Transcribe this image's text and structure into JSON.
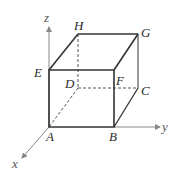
{
  "diagram": {
    "type": "cube-3d-axes",
    "axes": {
      "x": "x",
      "y": "y",
      "z": "z"
    },
    "vertices": {
      "A": "A",
      "B": "B",
      "C": "C",
      "D": "D",
      "E": "E",
      "F": "F",
      "G": "G",
      "H": "H"
    },
    "colors": {
      "edge": "#333333",
      "axis": "#777777",
      "hidden": "#555555"
    }
  }
}
